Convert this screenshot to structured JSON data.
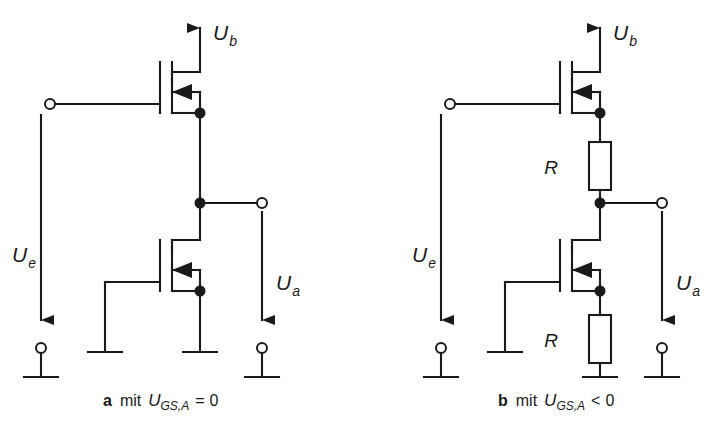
{
  "figure": {
    "background": "#ffffff",
    "stroke_color": "#1a1a1a",
    "text_color": "#1a1a1a",
    "width": 706,
    "height": 438
  },
  "circuit_a": {
    "caption_letter": "a",
    "caption_word": "mit",
    "caption_var": "U",
    "caption_sub": "GS,A",
    "caption_op": "=",
    "caption_value": "0",
    "caption_full": "a  mit U_GS,A = 0",
    "supply_label": "U",
    "supply_sub": "b",
    "input_label": "U",
    "input_sub": "e",
    "output_label": "U",
    "output_sub": "a",
    "components": [
      {
        "name": "load-transistor",
        "type": "mosfet",
        "position": "upper"
      },
      {
        "name": "driver-transistor",
        "type": "mosfet",
        "position": "lower"
      }
    ],
    "terminals": [
      {
        "name": "input-terminal",
        "type": "open-circle"
      },
      {
        "name": "output-terminal",
        "type": "open-circle"
      },
      {
        "name": "input-ground-terminal",
        "type": "open-circle-ground"
      },
      {
        "name": "output-ground-terminal",
        "type": "open-circle-ground"
      },
      {
        "name": "left-ground",
        "type": "ground-bar"
      },
      {
        "name": "center-ground",
        "type": "ground-bar"
      }
    ],
    "junctions": 3
  },
  "circuit_b": {
    "caption_letter": "b",
    "caption_word": "mit",
    "caption_var": "U",
    "caption_sub": "GS,A",
    "caption_op": "<",
    "caption_value": "0",
    "caption_full": "b  mit U_GS,A < 0",
    "supply_label": "U",
    "supply_sub": "b",
    "input_label": "U",
    "input_sub": "e",
    "output_label": "U",
    "output_sub": "a",
    "resistor_upper_label": "R",
    "resistor_lower_label": "R",
    "components": [
      {
        "name": "load-transistor",
        "type": "mosfet",
        "position": "upper"
      },
      {
        "name": "driver-transistor",
        "type": "mosfet",
        "position": "lower"
      },
      {
        "name": "upper-resistor",
        "type": "resistor",
        "label": "R"
      },
      {
        "name": "lower-resistor",
        "type": "resistor",
        "label": "R"
      }
    ],
    "terminals": [
      {
        "name": "input-terminal",
        "type": "open-circle"
      },
      {
        "name": "output-terminal",
        "type": "open-circle"
      },
      {
        "name": "input-ground-terminal",
        "type": "open-circle-ground"
      },
      {
        "name": "output-ground-terminal",
        "type": "open-circle-ground"
      },
      {
        "name": "left-ground",
        "type": "ground-bar"
      },
      {
        "name": "center-ground",
        "type": "ground-bar"
      }
    ],
    "junctions": 3
  }
}
